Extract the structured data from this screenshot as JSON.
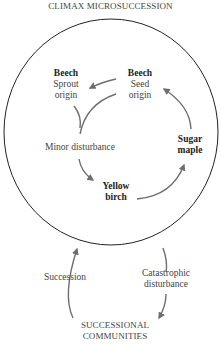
{
  "title": "CLIMAX MICROSUCCESSION",
  "colors": {
    "circle": "#222222",
    "arrow": "#6e6e6e",
    "text": "#444444",
    "bold_text": "#222222"
  },
  "nodes": {
    "beech_sprout": {
      "name": "Beech",
      "line1": "Sprout",
      "line2": "origin"
    },
    "beech_seed": {
      "name": "Beech",
      "line1": "Seed",
      "line2": "origin"
    },
    "minor_disturbance": {
      "label": "Minor disturbance"
    },
    "yellow_birch": {
      "line1": "Yellow",
      "line2": "birch"
    },
    "sugar_maple": {
      "line1": "Sugar",
      "line2": "maple"
    }
  },
  "outer_cycle": {
    "succession": "Succession",
    "catastrophic_line1": "Catastrophic",
    "catastrophic_line2": "disturbance",
    "communities_line1": "SUCCESSIONAL",
    "communities_line2": "COMMUNITIES"
  },
  "edges": [
    {
      "from": "beech_seed",
      "to": "beech_sprout"
    },
    {
      "from": "beech_seed",
      "to": "minor_disturbance"
    },
    {
      "from": "beech_sprout",
      "to": "minor_disturbance"
    },
    {
      "from": "minor_disturbance",
      "to": "yellow_birch"
    },
    {
      "from": "yellow_birch",
      "to": "sugar_maple"
    },
    {
      "from": "sugar_maple",
      "to": "beech_seed"
    },
    {
      "from": "climax_microsuccession",
      "to": "successional_communities",
      "label": "Catastrophic disturbance"
    },
    {
      "from": "successional_communities",
      "to": "climax_microsuccession",
      "label": "Succession"
    }
  ]
}
